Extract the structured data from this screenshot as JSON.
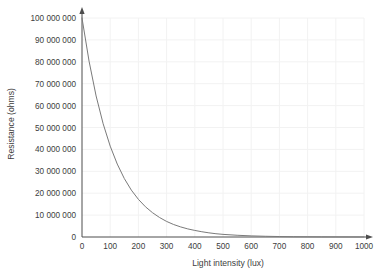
{
  "chart_data": {
    "type": "line",
    "title": "",
    "subtitle": "",
    "xlabel": "Light intensity (lux)",
    "ylabel": "Resistance (ohms)",
    "xlim": [
      0,
      1000
    ],
    "ylim": [
      0,
      100000000
    ],
    "grid": true,
    "legend": false,
    "legend_position": "none",
    "line_color": "#7a7a7a",
    "grid_color": "#f2f2f2",
    "axis_color": "#4d4d4d",
    "background_color": "#ffffff",
    "x_ticks": [
      0,
      100,
      200,
      300,
      400,
      500,
      600,
      700,
      800,
      900,
      1000
    ],
    "x_tick_labels": [
      "0",
      "100",
      "200",
      "300",
      "400",
      "500",
      "600",
      "700",
      "800",
      "900",
      "1000"
    ],
    "y_ticks": [
      0,
      10000000,
      20000000,
      30000000,
      40000000,
      50000000,
      60000000,
      70000000,
      80000000,
      90000000,
      100000000
    ],
    "y_tick_labels": [
      "0",
      "10 000 000",
      "20 000 000",
      "30 000 000",
      "40 000 000",
      "50 000 000",
      "60 000 000",
      "70 000 000",
      "80 000 000",
      "90 000 000",
      "100 000 000"
    ],
    "series": [
      {
        "name": "Resistance vs light intensity",
        "x": [
          0,
          25,
          50,
          75,
          100,
          125,
          150,
          175,
          200,
          225,
          250,
          275,
          300,
          325,
          350,
          375,
          400,
          425,
          450,
          475,
          500,
          550,
          600,
          650,
          700,
          750,
          800,
          850,
          900,
          950,
          1000
        ],
        "values": [
          100000000,
          80300000,
          64400000,
          51700000,
          41500000,
          33300000,
          26700000,
          21400000,
          17200000,
          13800000,
          11100000,
          8900000,
          7100000,
          5700000,
          4600000,
          3700000,
          3000000,
          2400000,
          1900000,
          1500000,
          1200000,
          800000,
          510000,
          330000,
          210000,
          130000,
          90000,
          55000,
          35000,
          23000,
          15000
        ]
      }
    ],
    "annotations": [
      {
        "name": "x-axis-arrowhead",
        "description": "arrow at right end of x axis"
      },
      {
        "name": "y-axis-arrowhead",
        "description": "arrow at top end of y axis"
      }
    ]
  }
}
